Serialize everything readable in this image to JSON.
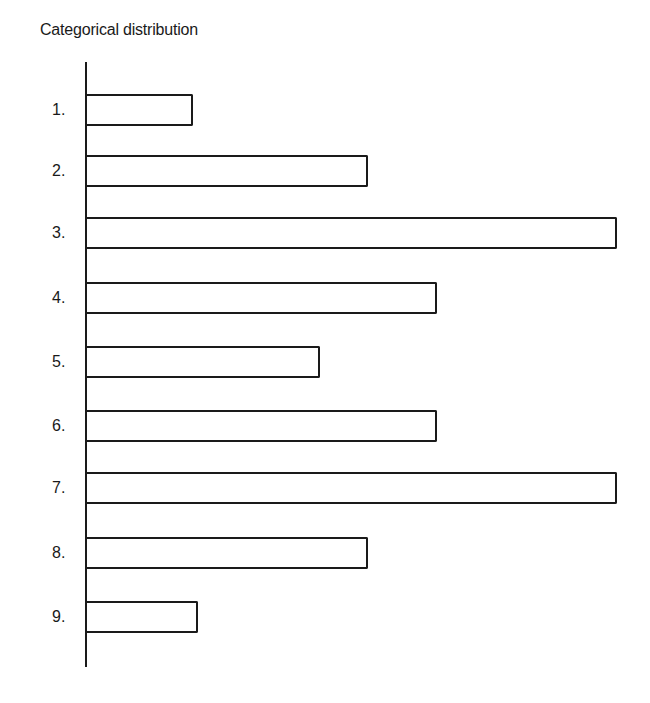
{
  "chart_data": {
    "type": "bar",
    "orientation": "horizontal",
    "title": "Categorical distribution",
    "xlabel": "",
    "ylabel": "",
    "categories": [
      "1.",
      "2.",
      "3.",
      "4.",
      "5.",
      "6.",
      "7.",
      "8.",
      "9."
    ],
    "values": [
      2.0,
      5.3,
      10.0,
      6.6,
      4.4,
      6.6,
      10.0,
      5.3,
      2.1
    ],
    "xlim": [
      0,
      10
    ],
    "grid": false,
    "legend": null,
    "bar_fill": "#ffffff",
    "bar_stroke": "#1a1a1a"
  },
  "layout": {
    "axis_x": 87,
    "px_per_unit": 53,
    "bar_tops": [
      94,
      155,
      217,
      282,
      346,
      410,
      472,
      537,
      601
    ],
    "bar_height": 32
  }
}
